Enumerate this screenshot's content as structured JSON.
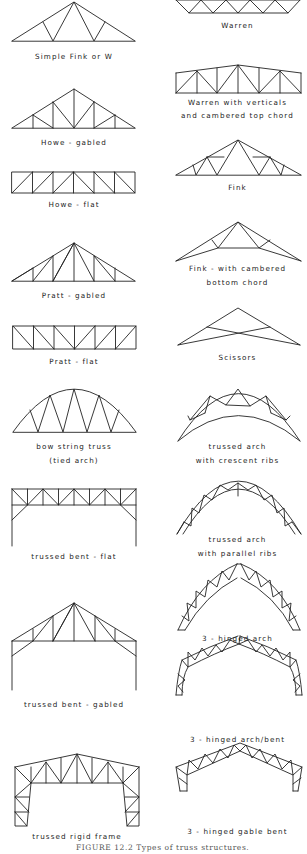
{
  "figure": {
    "caption": "FIGURE 12.2  Types of truss structures.",
    "left_column": [
      {
        "id": "simple-fink",
        "label": "Simple Fink  or  W"
      },
      {
        "id": "howe-gabled",
        "label": "Howe - gabled"
      },
      {
        "id": "howe-flat",
        "label": "Howe - flat"
      },
      {
        "id": "pratt-gabled",
        "label": "Pratt  -  gabled"
      },
      {
        "id": "pratt-flat",
        "label": "Pratt  -  flat"
      },
      {
        "id": "bow-string",
        "label": "bow string truss",
        "label2": "(tied arch)"
      },
      {
        "id": "trussed-bent-flat",
        "label": "trussed bent - flat"
      },
      {
        "id": "trussed-bent-gabled",
        "label": "trussed bent - gabled"
      },
      {
        "id": "trussed-rigid-frame",
        "label": "trussed rigid frame"
      }
    ],
    "right_column": [
      {
        "id": "warren",
        "label": "Warren"
      },
      {
        "id": "warren-verticals",
        "label": "Warren with verticals",
        "label2": "and cambered top chord"
      },
      {
        "id": "fink",
        "label": "Fink"
      },
      {
        "id": "fink-cambered",
        "label": "Fink  -  with cambered",
        "label2": "bottom chord"
      },
      {
        "id": "scissors",
        "label": "Scissors"
      },
      {
        "id": "trussed-arch-crescent",
        "label": "trussed arch",
        "label2": "with crescent ribs"
      },
      {
        "id": "trussed-arch-parallel",
        "label": "trussed arch",
        "label2": "with parallel ribs"
      },
      {
        "id": "three-hinged-arch",
        "label": "3 - hinged arch"
      },
      {
        "id": "three-hinged-arch-bent",
        "label": "3 - hinged arch/bent"
      },
      {
        "id": "three-hinged-gable-bent",
        "label": "3 - hinged gable bent"
      }
    ]
  }
}
